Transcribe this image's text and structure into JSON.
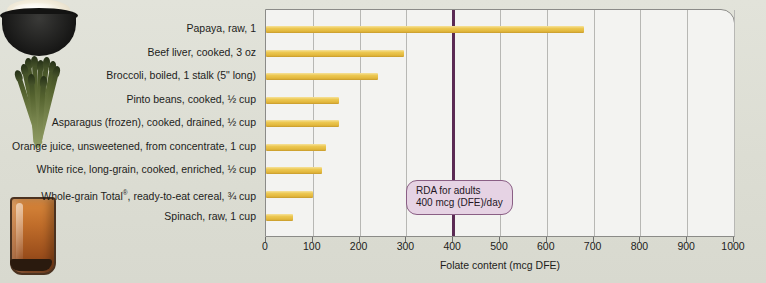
{
  "chart_data": {
    "type": "bar",
    "orientation": "horizontal",
    "title": "",
    "xlabel": "Folate content (mcg DFE)",
    "ylabel": "",
    "xlim": [
      0,
      1000
    ],
    "xticks": [
      0,
      100,
      200,
      300,
      400,
      500,
      600,
      700,
      800,
      900,
      1000
    ],
    "grid": true,
    "legend": "none",
    "bar_color": "#e8c252",
    "categories": [
      "Papaya, raw, 1",
      "Beef liver, cooked, 3 oz",
      "Broccoli, boiled, 1 stalk (5\" long)",
      "Pinto beans, cooked, ½ cup",
      "Asparagus (frozen), cooked, drained, ½ cup",
      "Orange juice, unsweetened, from concentrate, 1 cup",
      "White rice, long-grain, cooked, enriched, ½ cup",
      "Whole-grain Total®, ready-to-eat cereal, ¾ cup",
      "Spinach, raw, 1 cup"
    ],
    "values": [
      680,
      295,
      240,
      155,
      155,
      128,
      120,
      100,
      58
    ],
    "annotations": [
      {
        "type": "reference-line",
        "x": 400,
        "color": "#5b2a54",
        "label_line1": "RDA for adults",
        "label_line2": "400 mcg (DFE)/day"
      }
    ]
  },
  "categories_html": [
    "Papaya, raw, 1",
    "Beef liver, cooked, 3 oz",
    "Broccoli, boiled, 1 stalk (5&quot; long)",
    "Pinto beans, cooked, &frac12; cup",
    "Asparagus (frozen), cooked, drained, &frac12; cup",
    "Orange juice, unsweetened, from concentrate, 1 cup",
    "White rice, long-grain, cooked, enriched, &frac12; cup",
    "Whole-grain Total<sup>&reg;</sup>, ready-to-eat cereal, &frac34; cup",
    "Spinach, raw, 1 cup"
  ],
  "annotation": {
    "line1": "RDA for adults",
    "line2": "400 mcg (DFE)/day"
  },
  "axis": {
    "title": "Folate content (mcg DFE)",
    "ticks": [
      "0",
      "100",
      "200",
      "300",
      "400",
      "500",
      "600",
      "700",
      "800",
      "900",
      "1000"
    ]
  },
  "photos": [
    {
      "name": "bowl-of-rice-photo"
    },
    {
      "name": "asparagus-bundle-photo"
    },
    {
      "name": "orange-juice-glass-photo"
    }
  ],
  "colors": {
    "bar": "#e8c252",
    "rda_line": "#5b2a54",
    "rda_box_fill": "#e6d3e4",
    "rda_box_border": "#8a5f85",
    "plot_bg": "#f3f3f1",
    "page_bg": "#dfe0d7",
    "gridline": "#b7b7b4"
  }
}
